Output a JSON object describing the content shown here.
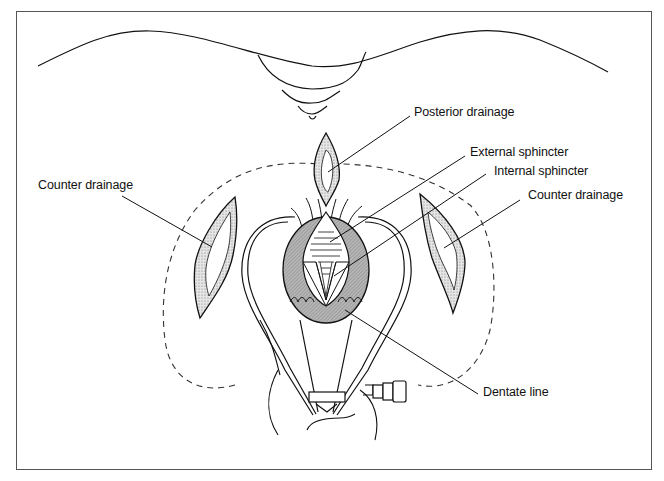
{
  "figure": {
    "type": "surgical-anatomy-diagram",
    "labels": {
      "posterior_drainage": "Posterior drainage",
      "external_sphincter": "External sphincter",
      "internal_sphincter": "Internal sphincter",
      "counter_drainage_left": "Counter drainage",
      "counter_drainage_right": "Counter drainage",
      "dentate_line": "Dentate line"
    },
    "colors": {
      "line": "#111111",
      "sphincter_fill": "#a8a8a8",
      "incision_fill": "#d0d0d0",
      "frame": "#555555"
    }
  }
}
